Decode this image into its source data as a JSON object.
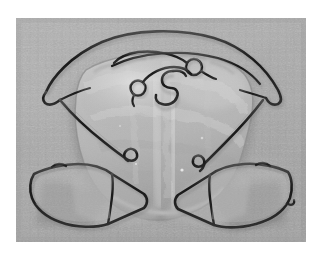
{
  "image": {
    "domain": "natural-image",
    "subject": "removable orthodontic appliance",
    "description": "Black and white photograph of a removable acrylic orthodontic plate (Hawley-type retainer / expansion appliance) resting on a grey textured cloth background",
    "orientation": "occlusal view, anterior at top",
    "color_mode": "grayscale",
    "alt_text": "Grayscale photo of a clear acrylic orthodontic retainer with a curved labial bow wire, two coiled finger springs, a Z-shaped spring, and two square Adams clasps at the lower left and lower right",
    "caption": ""
  },
  "canvas": {
    "width": 320,
    "height": 256,
    "background_color": "#ffffff"
  },
  "photo": {
    "x": 16,
    "y": 18,
    "width": 290,
    "height": 224,
    "background_color": "#a9a9a9",
    "background_texture": "woven grey cloth",
    "border_color": "#ffffff"
  },
  "palette": {
    "background_grey": "#a9a9a9",
    "background_grey_light": "#b8b8b8",
    "background_grey_dark": "#969696",
    "acrylic_light": "#c6c6c6",
    "acrylic_mid": "#b0b0b0",
    "acrylic_dark": "#8f8f8f",
    "acrylic_highlight": "#e2e2e2",
    "wire_dark": "#1c1c1c",
    "wire_mid": "#3a3a3a",
    "wire_highlight": "#8a8a8a",
    "shadow": "#7d7d7d",
    "white": "#ffffff"
  },
  "components": [
    {
      "id": "labial-bow",
      "label": "Labial bow",
      "type": "stainless steel wire arch",
      "position": "upper, spanning full width",
      "notes": "Smooth outer arc with small reverse hooks at both lateral ends"
    },
    {
      "id": "inner-bow",
      "label": "Inner guide wire",
      "type": "stainless steel wire arch",
      "position": "upper, just inside labial bow"
    },
    {
      "id": "finger-spring-left",
      "label": "Left finger spring",
      "type": "helical coil spring",
      "position": "anterior centre-left",
      "coil_turns": 1
    },
    {
      "id": "finger-spring-right",
      "label": "Right finger spring",
      "type": "helical coil spring",
      "position": "anterior centre-right",
      "coil_turns": 1
    },
    {
      "id": "z-spring",
      "label": "Z-spring",
      "type": "double-cantilever Z shaped spring",
      "position": "midline, anterior palate"
    },
    {
      "id": "acrylic-plate",
      "label": "Acrylic baseplate",
      "type": "clear self-cure acrylic",
      "position": "central body"
    },
    {
      "id": "arrowhead-clasp-left",
      "label": "Left retention wire",
      "type": "wire with terminal hook",
      "position": "mid-left flank"
    },
    {
      "id": "arrowhead-clasp-right",
      "label": "Right retention wire",
      "type": "wire with terminal hook",
      "position": "mid-right flank"
    },
    {
      "id": "adams-clasp-left",
      "label": "Left Adams clasp",
      "type": "quadrilateral clasp loop",
      "position": "lower left"
    },
    {
      "id": "adams-clasp-right",
      "label": "Right Adams clasp",
      "type": "quadrilateral clasp loop",
      "position": "lower right"
    }
  ],
  "labels": {
    "figure_number": "",
    "title": "",
    "footer": ""
  }
}
